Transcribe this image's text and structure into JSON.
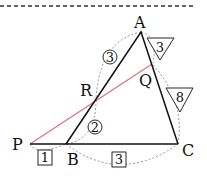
{
  "diagram": {
    "points": {
      "A": {
        "label": "A",
        "x": 141,
        "y": 32
      },
      "B": {
        "label": "B",
        "x": 66,
        "y": 144
      },
      "C": {
        "label": "C",
        "x": 178,
        "y": 144
      },
      "P": {
        "label": "P",
        "x": 30,
        "y": 144
      },
      "Q": {
        "label": "Q",
        "x": 152,
        "y": 64
      },
      "R": {
        "label": "R",
        "x": 95,
        "y": 100
      }
    },
    "ratio_labels": {
      "AR_circled": "3",
      "RB_circled": "2",
      "AQ_triangle": "3",
      "QC_triangle": "8",
      "PB_boxed": "1",
      "BC_boxed": "3"
    },
    "colors": {
      "line": "#111111",
      "red_line": "#e0707a",
      "dashed": "#888888"
    }
  }
}
